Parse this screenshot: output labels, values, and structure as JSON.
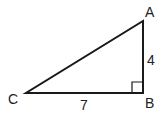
{
  "diagram": {
    "type": "right-triangle",
    "vertices": [
      {
        "name": "A",
        "x": 143,
        "y": 21,
        "label": "A",
        "label_x": 150,
        "label_y": 17
      },
      {
        "name": "B",
        "x": 143,
        "y": 93,
        "label": "B",
        "label_x": 150,
        "label_y": 108
      },
      {
        "name": "C",
        "x": 26,
        "y": 93,
        "label": "C",
        "label_x": 13,
        "label_y": 104
      }
    ],
    "sides": [
      {
        "name": "AB",
        "length_label": "4",
        "label_x": 151,
        "label_y": 65
      },
      {
        "name": "CB",
        "length_label": "7",
        "label_x": 84,
        "label_y": 109
      },
      {
        "name": "CA",
        "length_label": ""
      }
    ],
    "right_angle_at": "B",
    "right_angle_marker_size": 11,
    "colors": {
      "stroke": "#1a1a1a",
      "text": "#222222",
      "background": "#ffffff"
    }
  }
}
